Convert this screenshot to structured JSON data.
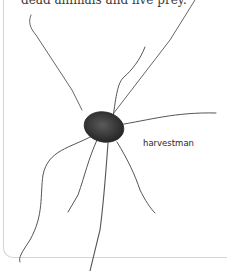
{
  "page": {
    "body_text_fragment": "dead animals and live prey.",
    "figure": {
      "subject": "harvestman-illustration",
      "caption": "harvestman"
    }
  }
}
